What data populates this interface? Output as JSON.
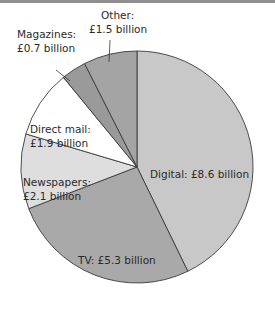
{
  "chart_data": {
    "type": "pie",
    "title": "",
    "unit": "£ billion",
    "categories": [
      "Digital",
      "TV",
      "Newspapers",
      "Direct mail",
      "Magazines",
      "Other"
    ],
    "values": [
      8.6,
      5.3,
      2.1,
      1.9,
      0.7,
      1.5
    ],
    "labels": [
      "Digital: £8.6 billion",
      "TV: £5.3 billion",
      "Newspapers: £2.1 billion",
      "Direct mail: £1.9 billion",
      "Magazines: £0.7 billion",
      "Other: £1.5 billion"
    ],
    "colors": [
      "#c8c8c8",
      "#a9a9a9",
      "#dedede",
      "#ffffff",
      "#9a9a9a",
      "#a4a4a4"
    ],
    "start_angle": "12 o'clock, clockwise",
    "legend": "none (inline labels)"
  },
  "labels": {
    "digital": "Digital: £8.6 billion",
    "tv": "TV: £5.3 billion",
    "newspapers_1": "Newspapers:",
    "newspapers_2": "£2.1 billion",
    "direct_mail_1": "Direct mail:",
    "direct_mail_2": "£1.9 billion",
    "magazines_1": "Magazines:",
    "magazines_2": "£0.7 billion",
    "other_1": "Other:",
    "other_2": "£1.5 billion"
  }
}
